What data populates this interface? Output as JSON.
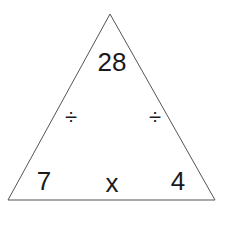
{
  "diagram": {
    "type": "fact-family-triangle",
    "top": "28",
    "bottom_left": "7",
    "bottom_right": "4",
    "bottom_operator": "x",
    "left_operator": "÷",
    "right_operator": "÷",
    "line_color": "#555555"
  }
}
